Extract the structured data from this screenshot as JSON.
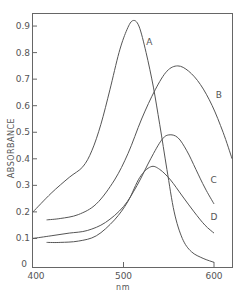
{
  "chart_data": {
    "type": "line",
    "title": "",
    "xlabel": "nm",
    "ylabel": "ABSORBANCE",
    "xlim": [
      400,
      620
    ],
    "ylim": [
      0,
      0.95
    ],
    "grid": false,
    "legend": "inline curve labels",
    "x_ticks": [
      400,
      500,
      600
    ],
    "x_tick_labels": [
      "400",
      "500",
      "600"
    ],
    "y_ticks": [
      0,
      0.1,
      0.2,
      0.3,
      0.4,
      0.5,
      0.6,
      0.7,
      0.8,
      0.9
    ],
    "y_tick_labels": [
      "0",
      "0.1",
      "0.2",
      "0.3",
      "0.4",
      "0.5",
      "0.6",
      "0.7",
      "0.8",
      "0.9"
    ],
    "series": [
      {
        "name": "A",
        "label_pos": [
          525,
          0.83
        ],
        "points": [
          [
            400,
            0.2
          ],
          [
            420,
            0.27
          ],
          [
            440,
            0.33
          ],
          [
            455,
            0.37
          ],
          [
            465,
            0.43
          ],
          [
            475,
            0.53
          ],
          [
            485,
            0.66
          ],
          [
            495,
            0.8
          ],
          [
            503,
            0.88
          ],
          [
            510,
            0.92
          ],
          [
            517,
            0.9
          ],
          [
            525,
            0.8
          ],
          [
            533,
            0.67
          ],
          [
            540,
            0.53
          ],
          [
            548,
            0.36
          ],
          [
            556,
            0.2
          ],
          [
            565,
            0.1
          ],
          [
            575,
            0.05
          ],
          [
            588,
            0.025
          ],
          [
            600,
            0.01
          ]
        ]
      },
      {
        "name": "B",
        "label_pos": [
          602,
          0.63
        ],
        "points": [
          [
            415,
            0.17
          ],
          [
            430,
            0.175
          ],
          [
            450,
            0.19
          ],
          [
            470,
            0.23
          ],
          [
            490,
            0.32
          ],
          [
            505,
            0.42
          ],
          [
            520,
            0.55
          ],
          [
            535,
            0.66
          ],
          [
            548,
            0.73
          ],
          [
            560,
            0.75
          ],
          [
            572,
            0.73
          ],
          [
            585,
            0.68
          ],
          [
            598,
            0.6
          ],
          [
            610,
            0.5
          ],
          [
            620,
            0.4
          ]
        ]
      },
      {
        "name": "C",
        "label_pos": [
          596,
          0.31
        ],
        "points": [
          [
            400,
            0.1
          ],
          [
            420,
            0.11
          ],
          [
            440,
            0.12
          ],
          [
            460,
            0.13
          ],
          [
            480,
            0.16
          ],
          [
            500,
            0.22
          ],
          [
            515,
            0.3
          ],
          [
            530,
            0.4
          ],
          [
            542,
            0.47
          ],
          [
            550,
            0.49
          ],
          [
            560,
            0.48
          ],
          [
            570,
            0.43
          ],
          [
            580,
            0.36
          ],
          [
            590,
            0.29
          ],
          [
            600,
            0.23
          ]
        ]
      },
      {
        "name": "D",
        "label_pos": [
          596,
          0.17
        ],
        "points": [
          [
            415,
            0.085
          ],
          [
            430,
            0.085
          ],
          [
            450,
            0.09
          ],
          [
            470,
            0.11
          ],
          [
            490,
            0.17
          ],
          [
            505,
            0.24
          ],
          [
            518,
            0.33
          ],
          [
            530,
            0.37
          ],
          [
            540,
            0.36
          ],
          [
            552,
            0.32
          ],
          [
            565,
            0.26
          ],
          [
            578,
            0.2
          ],
          [
            590,
            0.15
          ],
          [
            600,
            0.12
          ]
        ]
      }
    ]
  },
  "axes": {
    "x_label": "nm",
    "y_label": "ABSORBANCE",
    "origin_label": "0"
  },
  "curve_labels": {
    "A": "A",
    "B": "B",
    "C": "C",
    "D": "D"
  }
}
